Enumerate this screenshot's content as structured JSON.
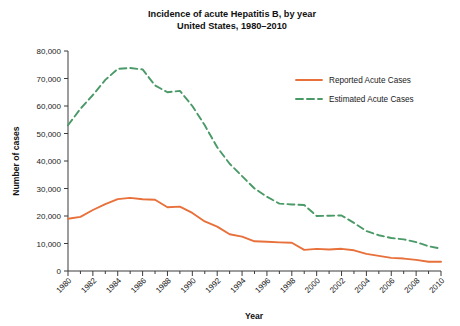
{
  "chart_data": {
    "type": "line",
    "title": "Incidence of acute Hepatitis B, by year",
    "subtitle": "United States, 1980–2010",
    "xlabel": "Year",
    "ylabel": "Number of cases",
    "grid": false,
    "legend_position": "upper right",
    "xlim": [
      1980,
      2010
    ],
    "ylim": [
      0,
      80000
    ],
    "ytick_labels": [
      "0",
      "10,000",
      "20,000",
      "30,000",
      "40,000",
      "50,000",
      "60,000",
      "70,000",
      "80,000"
    ],
    "ytick_values": [
      0,
      10000,
      20000,
      30000,
      40000,
      50000,
      60000,
      70000,
      80000
    ],
    "xtick_labels": [
      "1980",
      "1982",
      "1984",
      "1986",
      "1988",
      "1990",
      "1992",
      "1994",
      "1996",
      "1998",
      "2000",
      "2002",
      "2004",
      "2006",
      "2008",
      "2010"
    ],
    "xtick_values": [
      1980,
      1982,
      1984,
      1986,
      1988,
      1990,
      1992,
      1994,
      1996,
      1998,
      2000,
      2002,
      2004,
      2006,
      2008,
      2010
    ],
    "x": [
      1980,
      1981,
      1982,
      1983,
      1984,
      1985,
      1986,
      1987,
      1988,
      1989,
      1990,
      1991,
      1992,
      1993,
      1994,
      1995,
      1996,
      1997,
      1998,
      1999,
      2000,
      2001,
      2002,
      2003,
      2004,
      2005,
      2006,
      2007,
      2008,
      2009,
      2010
    ],
    "series": [
      {
        "name": "Reported Acute Cases",
        "color": "#E8703A",
        "style": "solid",
        "values": [
          19015,
          19700,
          22177,
          24318,
          26115,
          26611,
          26107,
          25916,
          23177,
          23419,
          21102,
          18003,
          16126,
          13361,
          12517,
          10805,
          10637,
          10416,
          10258,
          7694,
          8036,
          7844,
          8064,
          7526,
          6212,
          5494,
          4758,
          4519,
          4033,
          3371,
          3350
        ]
      },
      {
        "name": "Estimated Acute Cases",
        "color": "#4A9A68",
        "style": "dashed",
        "values": [
          53000,
          59000,
          64000,
          69500,
          73500,
          73800,
          73300,
          67500,
          65000,
          65500,
          60000,
          53000,
          45000,
          39000,
          34500,
          30000,
          27000,
          24500,
          24200,
          24000,
          20000,
          20100,
          20200,
          17500,
          14500,
          13000,
          12000,
          11500,
          10500,
          9000,
          8100
        ]
      }
    ]
  },
  "legend": {
    "items": [
      {
        "label": "Reported Acute Cases"
      },
      {
        "label": "Estimated Acute Cases"
      }
    ]
  }
}
